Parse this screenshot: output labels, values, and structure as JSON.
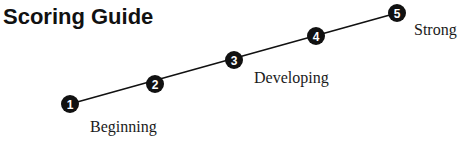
{
  "title": "Scoring Guide",
  "colors": {
    "ink": "#111111",
    "number": "#ffffff"
  },
  "steps": [
    {
      "number": "1",
      "cx": 70,
      "cy": 104
    },
    {
      "number": "2",
      "cx": 155,
      "cy": 84
    },
    {
      "number": "3",
      "cx": 234,
      "cy": 60
    },
    {
      "number": "4",
      "cx": 316,
      "cy": 36
    },
    {
      "number": "5",
      "cx": 397,
      "cy": 13
    }
  ],
  "labels": {
    "beginning": "Beginning",
    "developing": "Developing",
    "strong": "Strong"
  }
}
